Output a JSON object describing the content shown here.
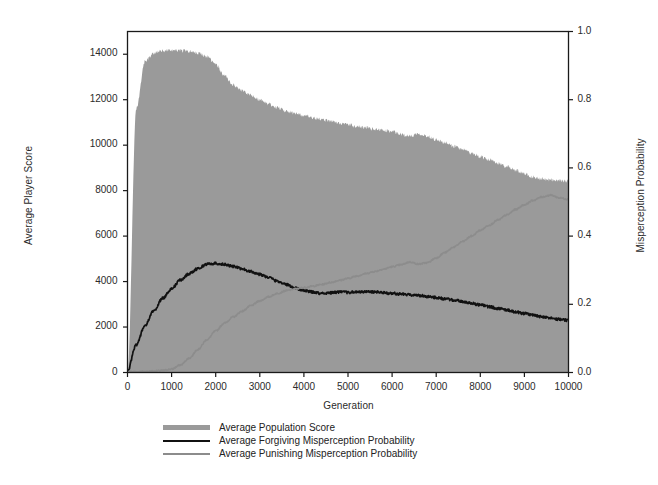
{
  "chart_data": {
    "type": "area",
    "title": "",
    "xlabel": "Generation",
    "ylabel": "Average Player Score",
    "ylabel_right": "Misperception Probability",
    "xlim": [
      0,
      10000
    ],
    "ylim": [
      0,
      15000
    ],
    "ylim_right": [
      0.0,
      1.0
    ],
    "grid": false,
    "legend_position": "below-center",
    "xticks": [
      "0",
      "1000",
      "2000",
      "3000",
      "4000",
      "5000",
      "6000",
      "7000",
      "8000",
      "9000",
      "10000"
    ],
    "xtick_values": [
      0,
      1000,
      2000,
      3000,
      4000,
      5000,
      6000,
      7000,
      8000,
      9000,
      10000
    ],
    "yticks_left": [
      "0",
      "2000",
      "4000",
      "6000",
      "8000",
      "10000",
      "12000",
      "14000"
    ],
    "ytick_values_left": [
      0,
      2000,
      4000,
      6000,
      8000,
      10000,
      12000,
      14000
    ],
    "yticks_right": [
      "0.0",
      "0.2",
      "0.4",
      "0.6",
      "0.8",
      "1.0"
    ],
    "ytick_values_right": [
      0.0,
      0.2,
      0.4,
      0.6,
      0.8,
      1.0
    ],
    "colors": {
      "area_fill": "#9a9a9a",
      "forgiving_line": "#111111",
      "punishing_line": "#8c8c8c",
      "axis": "#1a1a1a",
      "background": "#ffffff"
    },
    "series": [
      {
        "name": "Average Population Score",
        "type": "area",
        "axis": "left",
        "color": "#9a9a9a",
        "x": [
          0,
          200,
          400,
          600,
          800,
          1000,
          1200,
          1400,
          1600,
          1800,
          2000,
          2200,
          2400,
          2600,
          2800,
          3000,
          3200,
          3400,
          3600,
          3800,
          4000,
          4200,
          4400,
          4600,
          4800,
          5000,
          5200,
          5400,
          5600,
          5800,
          6000,
          6200,
          6400,
          6600,
          6800,
          7000,
          7200,
          7400,
          7600,
          7800,
          8000,
          8200,
          8400,
          8600,
          8800,
          9000,
          9200,
          9400,
          9600,
          9800,
          10000
        ],
        "values": [
          0,
          11600,
          13700,
          14050,
          14150,
          14180,
          14170,
          14120,
          14050,
          13900,
          13550,
          13050,
          12650,
          12400,
          12200,
          12000,
          11800,
          11650,
          11500,
          11400,
          11300,
          11200,
          11130,
          11050,
          10980,
          10900,
          10820,
          10780,
          10700,
          10650,
          10600,
          10480,
          10400,
          10520,
          10400,
          10250,
          10100,
          9950,
          9800,
          9650,
          9500,
          9350,
          9200,
          9050,
          8900,
          8750,
          8600,
          8500,
          8480,
          8450,
          8420
        ]
      },
      {
        "name": "Average Forgiving Misperception Probability",
        "type": "line",
        "axis": "right",
        "color": "#111111",
        "x": [
          0,
          200,
          400,
          600,
          800,
          1000,
          1200,
          1400,
          1600,
          1800,
          2000,
          2200,
          2400,
          2600,
          2800,
          3000,
          3200,
          3400,
          3600,
          3800,
          4000,
          4200,
          4400,
          4600,
          4800,
          5000,
          5200,
          5400,
          5600,
          5800,
          6000,
          6200,
          6400,
          6600,
          6800,
          7000,
          7200,
          7400,
          7600,
          7800,
          8000,
          8200,
          8400,
          8600,
          8800,
          9000,
          9200,
          9400,
          9600,
          9800,
          10000
        ],
        "values": [
          0.005,
          0.082,
          0.138,
          0.182,
          0.218,
          0.246,
          0.271,
          0.29,
          0.305,
          0.318,
          0.32,
          0.317,
          0.311,
          0.304,
          0.296,
          0.288,
          0.279,
          0.268,
          0.258,
          0.248,
          0.24,
          0.236,
          0.232,
          0.234,
          0.236,
          0.235,
          0.236,
          0.237,
          0.236,
          0.234,
          0.232,
          0.23,
          0.228,
          0.226,
          0.223,
          0.22,
          0.216,
          0.212,
          0.208,
          0.203,
          0.198,
          0.193,
          0.188,
          0.183,
          0.178,
          0.173,
          0.168,
          0.163,
          0.159,
          0.156,
          0.153
        ]
      },
      {
        "name": "Average Punishing Misperception Probability",
        "type": "line",
        "axis": "right",
        "color": "#8c8c8c",
        "x": [
          0,
          200,
          400,
          600,
          800,
          1000,
          1200,
          1400,
          1600,
          1800,
          2000,
          2200,
          2400,
          2600,
          2800,
          3000,
          3200,
          3400,
          3600,
          3800,
          4000,
          4200,
          4400,
          4600,
          4800,
          5000,
          5200,
          5400,
          5600,
          5800,
          6000,
          6200,
          6400,
          6600,
          6800,
          7000,
          7200,
          7400,
          7600,
          7800,
          8000,
          8200,
          8400,
          8600,
          8800,
          9000,
          9200,
          9400,
          9600,
          9800,
          10000
        ],
        "values": [
          0.002,
          0.002,
          0.003,
          0.004,
          0.006,
          0.01,
          0.022,
          0.042,
          0.068,
          0.096,
          0.122,
          0.145,
          0.163,
          0.18,
          0.196,
          0.21,
          0.222,
          0.232,
          0.24,
          0.245,
          0.249,
          0.253,
          0.258,
          0.264,
          0.27,
          0.276,
          0.283,
          0.29,
          0.296,
          0.303,
          0.31,
          0.316,
          0.324,
          0.318,
          0.322,
          0.336,
          0.352,
          0.368,
          0.384,
          0.4,
          0.417,
          0.432,
          0.447,
          0.462,
          0.478,
          0.492,
          0.505,
          0.515,
          0.52,
          0.512,
          0.508
        ]
      }
    ]
  },
  "legend": {
    "items": [
      {
        "label": "Average Population Score",
        "key": "area"
      },
      {
        "label": "Average Forgiving Misperception Probability",
        "key": "line-black"
      },
      {
        "label": "Average Punishing Misperception Probability",
        "key": "line-gray"
      }
    ]
  }
}
